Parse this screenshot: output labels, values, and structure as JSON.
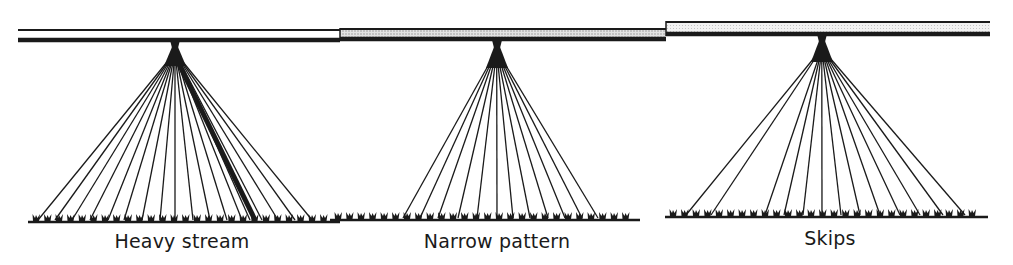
{
  "diagram": {
    "type": "spray-boom-nozzle-patterns",
    "colors": {
      "ink": "#1a1a1a",
      "pipe_fill_stipple": "#d4d4d4",
      "background": "#ffffff"
    },
    "boom": {
      "segments": [
        {
          "x1": 18,
          "x2": 340,
          "top_y": 30,
          "bottom_y": 40,
          "fill": "white"
        },
        {
          "x1": 340,
          "x2": 666,
          "top_y": 29,
          "bottom_y": 39,
          "fill": "stipple"
        },
        {
          "x1": 666,
          "x2": 990,
          "top_y": 22,
          "bottom_y": 34,
          "fill": "light"
        }
      ]
    },
    "panels": [
      {
        "id": "heavy-stream",
        "label": "Heavy stream",
        "nozzle_x": 175,
        "nozzle_y": 42,
        "apex_y": 62,
        "ground_y": 222,
        "ground_x1": 28,
        "ground_x2": 340,
        "spray_ends": [
          38,
          55,
          72,
          90,
          108,
          124,
          142,
          160,
          175,
          193,
          210,
          227,
          242,
          250,
          262,
          278,
          295,
          312
        ],
        "heavy_stream_end": 255,
        "label_x": 182,
        "label_y": 230
      },
      {
        "id": "narrow-pattern",
        "label": "Narrow pattern",
        "nozzle_x": 497,
        "nozzle_y": 42,
        "apex_y": 64,
        "ground_y": 220,
        "ground_x1": 330,
        "ground_x2": 640,
        "spray_ends": [
          403,
          420,
          438,
          458,
          477,
          497,
          513,
          530,
          548,
          565,
          582,
          598
        ],
        "label_x": 497,
        "label_y": 230
      },
      {
        "id": "skips",
        "label": "Skips",
        "nozzle_x": 822,
        "nozzle_y": 36,
        "apex_y": 58,
        "ground_y": 217,
        "ground_x1": 665,
        "ground_x2": 988,
        "spray_ends": [
          686,
          711,
          765,
          784,
          803,
          822,
          841,
          860,
          880,
          900,
          920,
          943,
          965
        ],
        "label_x": 830,
        "label_y": 227
      }
    ]
  }
}
